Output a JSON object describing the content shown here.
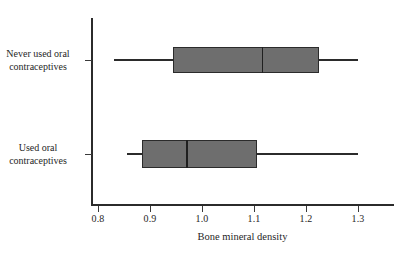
{
  "chart_data": {
    "type": "box",
    "title": "",
    "xlabel": "Bone mineral density",
    "ylabel": "",
    "xlim": [
      0.8,
      1.335
    ],
    "xticks": [
      "0.8",
      "0.9",
      "1.0",
      "1.1",
      "1.2",
      "1.3"
    ],
    "xtick_values": [
      0.8,
      0.9,
      1.0,
      1.1,
      1.2,
      1.3
    ],
    "grid": false,
    "legend": "none",
    "orientation": "horizontal",
    "categories": [
      "Never used oral contraceptives",
      "Used oral contraceptives"
    ],
    "boxes": [
      {
        "name": "Never used oral contraceptives",
        "label_line1": "Never used oral",
        "label_line2": "contraceptives",
        "min": 0.83,
        "q1": 0.945,
        "median": 1.115,
        "q3": 1.225,
        "max": 1.3
      },
      {
        "name": "Used oral contraceptives",
        "label_line1": "Used oral",
        "label_line2": "contraceptives",
        "min": 0.855,
        "q1": 0.885,
        "median": 0.97,
        "q3": 1.105,
        "max": 1.3
      }
    ],
    "colors": {
      "box_fill": "#6e6e6e",
      "line": "#2b2b2b",
      "background": "#ffffff",
      "text": "#262626"
    }
  }
}
